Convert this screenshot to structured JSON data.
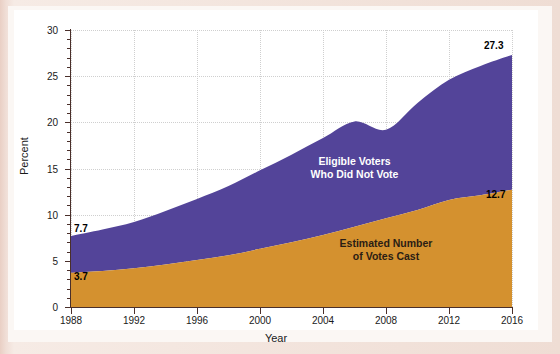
{
  "chart_data": {
    "type": "area",
    "stacked": true,
    "title": "",
    "xlabel": "Year",
    "ylabel": "Percent",
    "x": [
      1988,
      1990,
      1992,
      1994,
      1996,
      1998,
      2000,
      2002,
      2004,
      2006,
      2008,
      2010,
      2012,
      2014,
      2016
    ],
    "xlim": [
      1988,
      2016
    ],
    "ylim": [
      0,
      30
    ],
    "xticks": [
      "1988",
      "1992",
      "1996",
      "2000",
      "2004",
      "2008",
      "2012",
      "2016"
    ],
    "yticks": [
      "0",
      "5",
      "10",
      "15",
      "20",
      "25",
      "30"
    ],
    "grid": true,
    "legend": "inline-labels",
    "series": [
      {
        "name": "Estimated Number of Votes Cast",
        "label_line1": "Estimated Number",
        "label_line2": "of Votes Cast",
        "color": "#d4912f",
        "values": [
          3.7,
          3.9,
          4.2,
          4.6,
          5.1,
          5.6,
          6.3,
          7.0,
          7.8,
          8.7,
          9.6,
          10.5,
          11.6,
          12.1,
          12.7
        ],
        "start_label": "3.7",
        "end_label": "12.7"
      },
      {
        "name": "Eligible Voters Who Did Not Vote",
        "label_line1": "Eligible Voters",
        "label_line2": "Who Did Not Vote",
        "color": "#534499",
        "values": [
          4.0,
          4.5,
          5.0,
          5.8,
          6.6,
          7.5,
          8.5,
          9.5,
          10.5,
          11.4,
          9.6,
          11.6,
          13.0,
          14.0,
          14.6
        ],
        "cumulative": [
          7.7,
          8.4,
          9.2,
          10.4,
          11.7,
          13.1,
          14.8,
          16.5,
          18.3,
          20.1,
          19.2,
          22.1,
          24.6,
          26.1,
          27.3
        ],
        "start_label": "7.7",
        "end_label": "27.3"
      }
    ],
    "annotations": [
      {
        "name": "total-1988",
        "text": "7.7",
        "year": 1988,
        "value": 7.7
      },
      {
        "name": "votes-1988",
        "text": "3.7",
        "year": 1988,
        "value": 3.7
      },
      {
        "name": "total-2016",
        "text": "27.3",
        "year": 2016,
        "value": 27.3
      },
      {
        "name": "votes-2016",
        "text": "12.7",
        "year": 2016,
        "value": 12.7
      }
    ]
  },
  "colors": {
    "purple": "#534499",
    "orange": "#d4912f",
    "axis": "#4a2f2a",
    "grid": "#cfcfcf",
    "page": "#efddd4",
    "canvas": "#ffffff"
  }
}
